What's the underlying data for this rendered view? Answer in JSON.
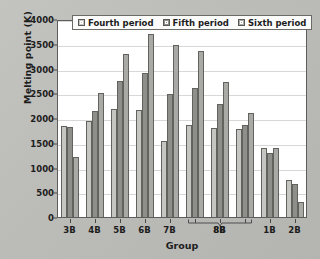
{
  "chart_data": {
    "type": "bar",
    "title": "",
    "xlabel": "Group",
    "ylabel": "Melting point (K)",
    "ylim": [
      0,
      4000
    ],
    "yticks": [
      0,
      500,
      1000,
      1500,
      2000,
      2500,
      3000,
      3500,
      4000
    ],
    "grid": true,
    "legend_position": "top-center",
    "categories": [
      "3B",
      "4B",
      "5B",
      "6B",
      "7B",
      "8B",
      "8B",
      "8B",
      "1B",
      "2B"
    ],
    "tick_labels": [
      "3B",
      "4B",
      "5B",
      "6B",
      "7B",
      "",
      "8B",
      "",
      "1B",
      "2B"
    ],
    "group_bracket": {
      "label": "8B",
      "spans_categories": [
        5,
        6,
        7
      ]
    },
    "series": [
      {
        "name": "Fourth period",
        "color": "#c5c5c2",
        "values": [
          1830,
          1940,
          2180,
          2160,
          1540,
          1850,
          1790,
          1770,
          1400,
          750
        ]
      },
      {
        "name": "Fifth period",
        "color": "#8e8e8b",
        "values": [
          1810,
          2150,
          2750,
          2900,
          2480,
          2610,
          2290,
          1860,
          1290,
          670
        ]
      },
      {
        "name": "Sixth period",
        "color": "#a9a9a6",
        "values": [
          1220,
          2500,
          3290,
          3700,
          3470,
          3350,
          2720,
          2100,
          1400,
          300
        ]
      }
    ]
  },
  "legend": {
    "items": [
      {
        "label": "Fourth period",
        "swatch_class": "p4"
      },
      {
        "label": "Fifth period",
        "swatch_class": "p5"
      },
      {
        "label": "Sixth period",
        "swatch_class": "p6"
      }
    ]
  },
  "colors": {
    "background": "#bcbcb9",
    "plot_background": "#ffffff",
    "axis": "#5d5d5d",
    "gridline": "#d8d8d8",
    "text": "#1d1d1d"
  }
}
